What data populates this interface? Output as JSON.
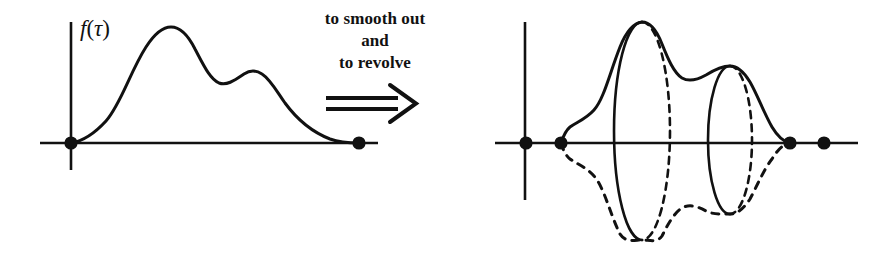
{
  "figure": {
    "background_color": "#ffffff",
    "ink_color": "#111111",
    "width": 870,
    "height": 256
  },
  "left_panel": {
    "name": "profile-function-plot",
    "function_label": "f(τ)",
    "function_label_parts": {
      "f": "f",
      "open": "(",
      "tau": "τ",
      "close": ")"
    },
    "axis": {
      "x_axis_y": 143,
      "y_axis_x": 71,
      "x_axis_start": 40,
      "x_axis_end": 378,
      "y_axis_top": 22,
      "y_axis_bottom": 170
    },
    "endpoint_dots": [
      {
        "name": "left-endpoint-dot",
        "x": 71,
        "y": 143
      },
      {
        "name": "right-endpoint-dot",
        "x": 359,
        "y": 143
      }
    ],
    "curve_features": {
      "start": [
        71,
        143
      ],
      "main_peak": [
        170,
        28
      ],
      "valley": [
        222,
        80
      ],
      "secondary_peak": [
        253,
        71
      ],
      "end": [
        359,
        143
      ]
    }
  },
  "right_panel": {
    "name": "surface-of-revolution-plot",
    "axis": {
      "x_axis_y": 143,
      "y_axis_x": 525,
      "x_axis_start": 495,
      "x_axis_end": 858,
      "y_axis_top": 22,
      "y_axis_bottom": 200
    },
    "endpoint_dots": [
      {
        "name": "origin-dot",
        "x": 526,
        "y": 143
      },
      {
        "name": "profile-start-dot",
        "x": 561,
        "y": 143
      },
      {
        "name": "profile-end-dot",
        "x": 790,
        "y": 143
      },
      {
        "name": "far-right-dot",
        "x": 824,
        "y": 143
      }
    ],
    "upper_curve_features": {
      "start": [
        561,
        143
      ],
      "main_peak": [
        642,
        22
      ],
      "valley": [
        690,
        79
      ],
      "secondary_peak": [
        730,
        66
      ],
      "end": [
        790,
        143
      ]
    },
    "lower_mirror_curve_features": {
      "start": [
        561,
        143
      ],
      "main_trough": [
        642,
        240
      ],
      "ridge": [
        690,
        203
      ],
      "secondary_trough": [
        730,
        214
      ],
      "end": [
        790,
        143
      ]
    },
    "cross_sections": [
      {
        "name": "cross-section-ellipse-major",
        "center_x": 642,
        "top_y": 22,
        "bottom_y": 240,
        "half_width": 28,
        "near_half": "solid-left",
        "far_half": "dashed-right"
      },
      {
        "name": "cross-section-ellipse-minor",
        "center_x": 730,
        "top_y": 66,
        "bottom_y": 214,
        "half_width": 22,
        "near_half": "solid-left",
        "far_half": "dashed-right"
      }
    ]
  },
  "caption": {
    "name": "transformation-caption",
    "lines": [
      "to smooth out",
      "and",
      "to revolve"
    ],
    "line1": "to smooth out",
    "line2": "and",
    "line3": "to revolve",
    "arrow_symbol": "⟹",
    "arrow_meaning": "implies"
  }
}
